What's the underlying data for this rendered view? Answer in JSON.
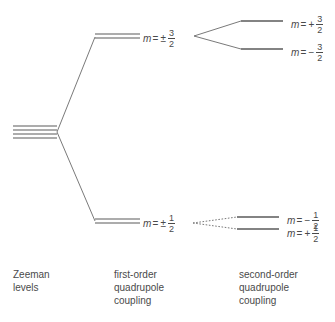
{
  "figure": {
    "type": "energy-level-splitting-diagram",
    "background_color": "#ffffff",
    "line_color": "#555555",
    "text_color": "#4a4a4a"
  },
  "columns": [
    {
      "id": "zeeman",
      "caption": "Zeeman\nlevels"
    },
    {
      "id": "first-order",
      "caption": "first-order\nquadrupole\ncoupling"
    },
    {
      "id": "second-order",
      "caption": "second-order\nquadrupole\ncoupling"
    }
  ],
  "labels": {
    "first_order_upper": {
      "var": "m",
      "eq": "=",
      "sign": "±",
      "num": "3",
      "den": "2"
    },
    "first_order_lower": {
      "var": "m",
      "eq": "=",
      "sign": "±",
      "num": "1",
      "den": "2"
    },
    "second_order_1": {
      "var": "m",
      "eq": "=",
      "sign": "+",
      "num": "3",
      "den": "2"
    },
    "second_order_2": {
      "var": "m",
      "eq": "=",
      "sign": "−",
      "num": "3",
      "den": "2"
    },
    "second_order_3": {
      "var": "m",
      "eq": "=",
      "sign": "−",
      "num": "1",
      "den": "2"
    },
    "second_order_4": {
      "var": "m",
      "eq": "=",
      "sign": "+",
      "num": "1",
      "den": "2"
    }
  },
  "levels": {
    "zeeman_multiplet_count": "4",
    "first_order_upper_lines": "2",
    "first_order_lower_lines": "2",
    "second_order_lines": "4"
  }
}
